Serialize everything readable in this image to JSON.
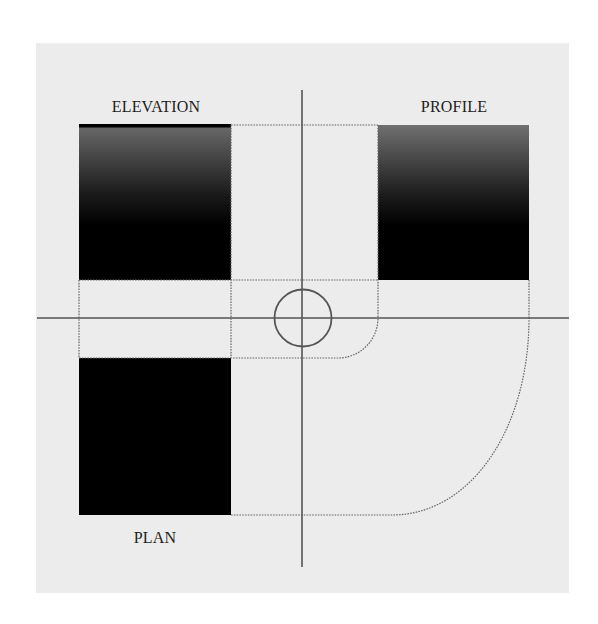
{
  "diagram": {
    "type": "orthographic-projection",
    "labels": {
      "elevation": "ELEVATION",
      "profile": "PROFILE",
      "plan": "PLAN"
    },
    "colors": {
      "page_background": "#ffffff",
      "panel_background": "#ececec",
      "axis_line": "#555555",
      "dotted_line": "#666666",
      "box_fill_dark": "#000000",
      "box_gradient_top": "#6a6a6a",
      "label_text": "#1e1e1e"
    },
    "elements": [
      {
        "id": "elevation-view",
        "shape": "rectangle",
        "fill": "gradient gray-to-black",
        "top_edge": "thick black"
      },
      {
        "id": "profile-view",
        "shape": "rectangle",
        "fill": "gradient gray-to-black"
      },
      {
        "id": "plan-view",
        "shape": "rectangle",
        "fill": "solid black"
      },
      {
        "id": "center-circle",
        "shape": "circle"
      },
      {
        "id": "horizontal-axis",
        "shape": "line"
      },
      {
        "id": "vertical-axis",
        "shape": "line"
      },
      {
        "id": "projection-guides",
        "shape": "dotted lines with arcs"
      }
    ]
  }
}
